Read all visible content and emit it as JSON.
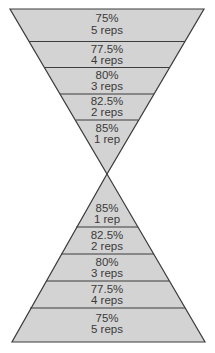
{
  "colors": {
    "fill": "#d3d3d3",
    "stroke": "#3c3c3c",
    "text": "#3a3a3a"
  },
  "top_triangle": {
    "bands": [
      {
        "percent": "75%",
        "reps": "5 reps"
      },
      {
        "percent": "77.5%",
        "reps": "4 reps"
      },
      {
        "percent": "80%",
        "reps": "3 reps"
      },
      {
        "percent": "82.5%",
        "reps": "2 reps"
      },
      {
        "percent": "85%",
        "reps": "1 rep"
      }
    ]
  },
  "bottom_triangle": {
    "bands": [
      {
        "percent": "85%",
        "reps": "1 rep"
      },
      {
        "percent": "82.5%",
        "reps": "2 reps"
      },
      {
        "percent": "80%",
        "reps": "3 reps"
      },
      {
        "percent": "77.5%",
        "reps": "4 reps"
      },
      {
        "percent": "75%",
        "reps": "5 reps"
      }
    ]
  }
}
